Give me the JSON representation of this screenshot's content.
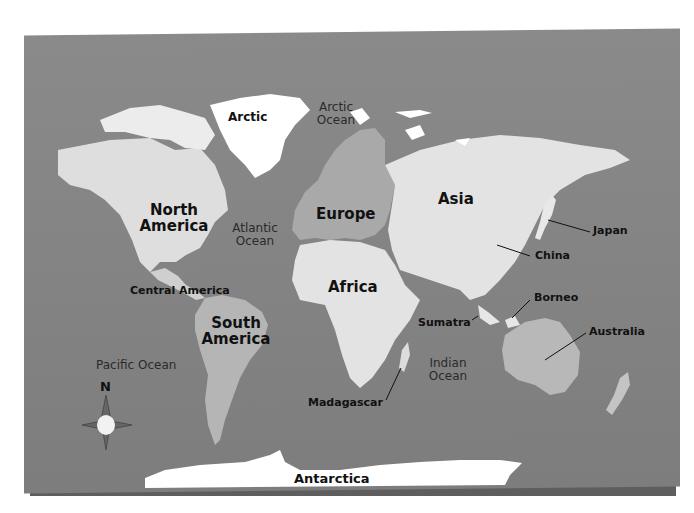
{
  "map": {
    "title": "World Map",
    "colors": {
      "background": "#ffffff",
      "board": "#858585",
      "board_edge": "#5e5e5e",
      "land_light": "#e6e6e6",
      "land_mid": "#bdbdbd",
      "europe": "#a8a8a8",
      "ice": "#ffffff",
      "label_text": "#111111"
    },
    "continents": {
      "north_america": "North America",
      "south_america": "South America",
      "europe": "Europe",
      "asia": "Asia",
      "africa": "Africa",
      "antarctica": "Antarctica",
      "arctic": "Arctic"
    },
    "regions": {
      "central_america": "Central America",
      "japan": "Japan",
      "china": "China",
      "borneo": "Borneo",
      "sumatra": "Sumatra",
      "australia": "Australia",
      "madagascar": "Madagascar"
    },
    "oceans": {
      "arctic": "Arctic Ocean",
      "atlantic": "Atlantic Ocean",
      "pacific": "Pacific Ocean",
      "indian": "Indian Ocean"
    },
    "compass": {
      "north_label": "N"
    }
  }
}
